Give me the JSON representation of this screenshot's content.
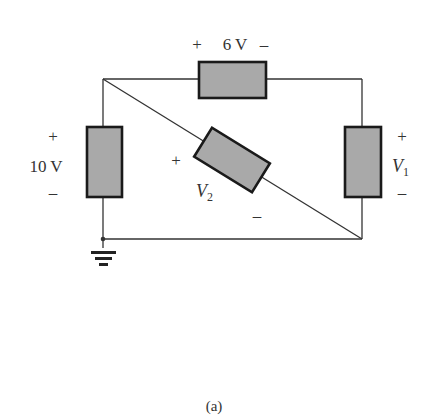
{
  "figure": {
    "caption": "(a)",
    "colors": {
      "wire": "#333333",
      "element_fill": "#a9a9a9",
      "element_stroke": "#1a1a1a",
      "text": "#333333",
      "background": "#ffffff"
    }
  },
  "elements": {
    "top": {
      "plus": "+",
      "value": "6 V",
      "minus": "–"
    },
    "left": {
      "plus": "+",
      "value": "10 V",
      "minus": "–"
    },
    "right": {
      "plus": "+",
      "symbol": "V",
      "subscript": "1",
      "minus": "–"
    },
    "diagonal": {
      "plus": "+",
      "symbol": "V",
      "subscript": "2",
      "minus": "–"
    }
  },
  "ground": {
    "icon": "ground-icon"
  }
}
